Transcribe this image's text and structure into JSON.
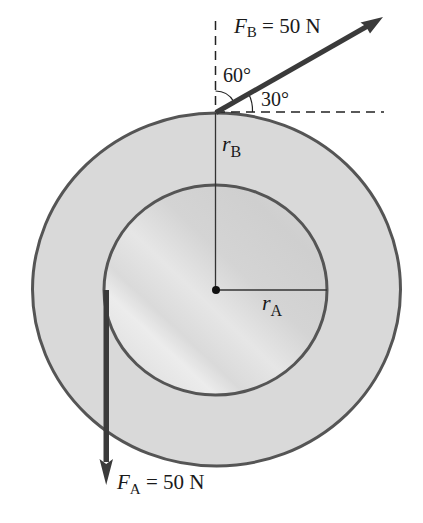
{
  "figure": {
    "type": "pulley-free-body-diagram",
    "colors": {
      "background": "#ffffff",
      "outer_ring_fill": "#d9d9d9",
      "inner_disk_fill": "#dcdcdc",
      "inner_disk_highlight": "#f2f2f2",
      "outline": "#555555",
      "force_arrow": "#3a3a3a",
      "radius_line": "#333333",
      "dashed_line": "#222222",
      "text": "#1a1a1a"
    }
  },
  "forces": {
    "FB": {
      "symbol": "F",
      "subscript": "B",
      "equals": " = ",
      "magnitude": "50 N",
      "angle_from_vertical": "60°",
      "angle_from_horizontal": "30°"
    },
    "FA": {
      "symbol": "F",
      "subscript": "A",
      "equals": " = ",
      "magnitude": "50 N"
    }
  },
  "radii": {
    "outer": {
      "symbol": "r",
      "subscript": "B"
    },
    "inner": {
      "symbol": "r",
      "subscript": "A"
    }
  },
  "angles": {
    "a60": "60°",
    "a30": "30°"
  }
}
